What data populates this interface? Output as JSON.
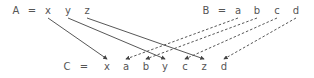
{
  "rows": {
    "A": {
      "name": "A",
      "eq": "=",
      "items": [
        "x",
        "y",
        "z"
      ],
      "name_x": 16,
      "eq_x": 32,
      "xs": [
        48,
        68,
        87
      ],
      "y": 14
    },
    "B": {
      "name": "B",
      "eq": "=",
      "items": [
        "a",
        "b",
        "c",
        "d"
      ],
      "name_x": 206,
      "eq_x": 222,
      "xs": [
        238,
        257,
        277,
        296
      ],
      "y": 14
    },
    "C": {
      "name": "C",
      "eq": "=",
      "items": [
        "x",
        "a",
        "b",
        "y",
        "c",
        "z",
        "d"
      ],
      "name_x": 67,
      "eq_x": 84,
      "xs": [
        107,
        126,
        146,
        165,
        185,
        204,
        224
      ],
      "y": 70
    }
  },
  "edges": [
    {
      "from": "A",
      "from_index": 0,
      "to_index": 0,
      "style": "solid"
    },
    {
      "from": "A",
      "from_index": 1,
      "to_index": 3,
      "style": "solid"
    },
    {
      "from": "A",
      "from_index": 2,
      "to_index": 5,
      "style": "solid"
    },
    {
      "from": "B",
      "from_index": 0,
      "to_index": 1,
      "style": "dashed"
    },
    {
      "from": "B",
      "from_index": 1,
      "to_index": 2,
      "style": "dashed"
    },
    {
      "from": "B",
      "from_index": 2,
      "to_index": 4,
      "style": "dashed"
    },
    {
      "from": "B",
      "from_index": 3,
      "to_index": 6,
      "style": "dashed"
    }
  ],
  "colors": {
    "line": "#444444",
    "text": "#555555"
  }
}
